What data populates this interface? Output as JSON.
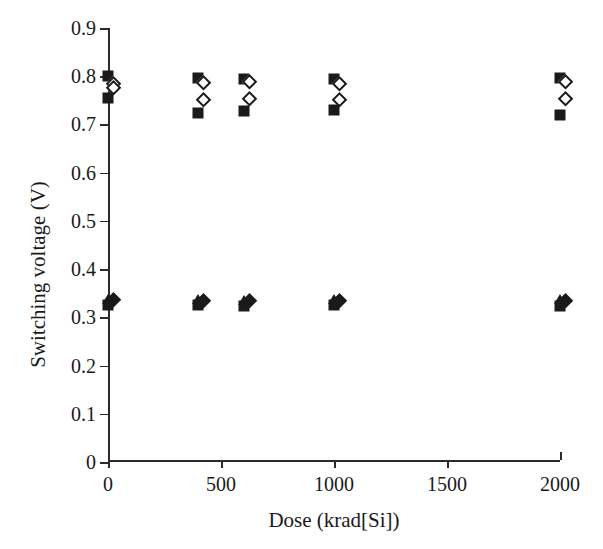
{
  "chart_data": {
    "type": "scatter",
    "title": "",
    "xlabel": "Dose (krad[Si])",
    "ylabel": "Switching voltage (V)",
    "xlim": [
      0,
      2000
    ],
    "ylim": [
      0,
      0.9
    ],
    "grid": false,
    "legend": "none",
    "x_ticks": [
      "0",
      "500",
      "1000",
      "1500",
      "2000"
    ],
    "x_tick_values": [
      0,
      500,
      1000,
      1500,
      2000
    ],
    "y_ticks": [
      "0",
      "0.1",
      "0.2",
      "0.3",
      "0.4",
      "0.5",
      "0.6",
      "0.7",
      "0.8",
      "0.9"
    ],
    "y_tick_values": [
      0,
      0.1,
      0.2,
      0.3,
      0.4,
      0.5,
      0.6,
      0.7,
      0.8,
      0.9
    ],
    "marker_color": "#1a1a1a",
    "axis_color": "#2b2b2b",
    "series": [
      {
        "name": "upper-filled-square-high",
        "marker": "filled-square",
        "x": [
          0,
          400,
          600,
          1000,
          2000
        ],
        "values": [
          0.801,
          0.796,
          0.794,
          0.795,
          0.797
        ]
      },
      {
        "name": "upper-open-diamond-high",
        "marker": "open-diamond",
        "x": [
          0,
          400,
          600,
          1000,
          2000
        ],
        "values": [
          0.779,
          0.781,
          0.784,
          0.779,
          0.783
        ]
      },
      {
        "name": "upper-open-diamond-low",
        "marker": "open-diamond",
        "x": [
          0,
          400,
          600,
          1000,
          2000
        ],
        "values": [
          0.772,
          0.746,
          0.748,
          0.747,
          0.749
        ]
      },
      {
        "name": "upper-filled-square-low",
        "marker": "filled-square",
        "x": [
          0,
          400,
          600,
          1000,
          2000
        ],
        "values": [
          0.755,
          0.724,
          0.727,
          0.729,
          0.72
        ]
      },
      {
        "name": "lower-triangle",
        "marker": "filled-triangle",
        "x": [
          0,
          400,
          600,
          1000,
          2000
        ],
        "values": [
          0.338,
          0.337,
          0.336,
          0.337,
          0.337
        ]
      },
      {
        "name": "lower-filled-diamond",
        "marker": "filled-diamond",
        "x": [
          0,
          400,
          600,
          1000,
          2000
        ],
        "values": [
          0.331,
          0.33,
          0.33,
          0.33,
          0.33
        ]
      },
      {
        "name": "lower-filled-square",
        "marker": "filled-square",
        "x": [
          0,
          400,
          600,
          1000,
          2000
        ],
        "values": [
          0.325,
          0.325,
          0.324,
          0.325,
          0.324
        ]
      }
    ]
  }
}
